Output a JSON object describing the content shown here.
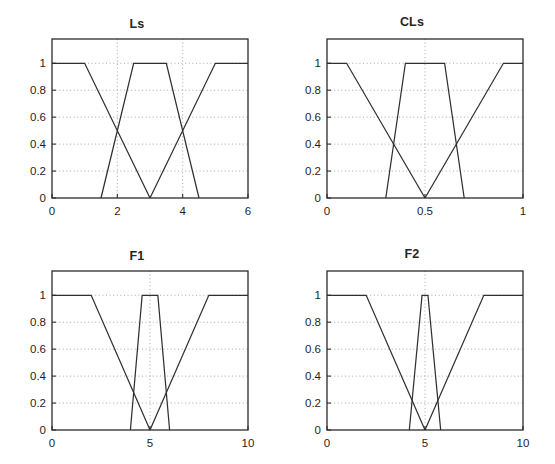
{
  "figure": {
    "background_color": "#ffffff",
    "axis_color": "#2b2b2b",
    "grid_color": "#9a9a9a",
    "curve_color": "#303030",
    "text_color": "#1f1f1f",
    "layout": "2x2 subplot grid"
  },
  "chart_data": [
    {
      "type": "line",
      "title": "Ls",
      "xlabel": "",
      "ylabel": "",
      "xlim": [
        0,
        6
      ],
      "ylim": [
        0,
        1.18
      ],
      "xticks": [
        0,
        2,
        4,
        6
      ],
      "xtick_labels": [
        "0",
        "2",
        "4",
        "6"
      ],
      "yticks": [
        0,
        0.2,
        0.4,
        0.6,
        0.8,
        1
      ],
      "ytick_labels": [
        "0",
        "0.2",
        "0.4",
        "0.6",
        "0.8",
        "1"
      ],
      "grid": true,
      "legend": "none",
      "series": [
        {
          "name": "low",
          "x": [
            0,
            1,
            3
          ],
          "values": [
            1,
            1,
            0
          ]
        },
        {
          "name": "medium",
          "x": [
            1.5,
            2.5,
            3.5,
            4.5
          ],
          "values": [
            0,
            1,
            1,
            0
          ]
        },
        {
          "name": "high",
          "x": [
            3,
            5,
            6
          ],
          "values": [
            0,
            1,
            1
          ]
        }
      ],
      "crossings": [
        {
          "x": 2,
          "y": 0.5
        },
        {
          "x": 4,
          "y": 0.5
        }
      ]
    },
    {
      "type": "line",
      "title": "CLs",
      "xlabel": "",
      "ylabel": "",
      "xlim": [
        0,
        1
      ],
      "ylim": [
        0,
        1.18
      ],
      "xticks": [
        0,
        0.5,
        1
      ],
      "xtick_labels": [
        "0",
        "0.5",
        "1"
      ],
      "yticks": [
        0,
        0.2,
        0.4,
        0.6,
        0.8,
        1
      ],
      "ytick_labels": [
        "0",
        "0.2",
        "0.4",
        "0.6",
        "0.8",
        "1"
      ],
      "grid": true,
      "legend": "none",
      "series": [
        {
          "name": "low",
          "x": [
            0,
            0.1,
            0.5
          ],
          "values": [
            1,
            1,
            0
          ]
        },
        {
          "name": "medium",
          "x": [
            0.3,
            0.4,
            0.6,
            0.7
          ],
          "values": [
            0,
            1,
            1,
            0
          ]
        },
        {
          "name": "high",
          "x": [
            0.5,
            0.9,
            1
          ],
          "values": [
            0,
            1,
            1
          ]
        }
      ],
      "crossings": [
        {
          "x": 0.34,
          "y": 0.41
        },
        {
          "x": 0.66,
          "y": 0.41
        }
      ]
    },
    {
      "type": "line",
      "title": "F1",
      "xlabel": "",
      "ylabel": "",
      "xlim": [
        0,
        10
      ],
      "ylim": [
        0,
        1.18
      ],
      "xticks": [
        0,
        5,
        10
      ],
      "xtick_labels": [
        "0",
        "5",
        "10"
      ],
      "yticks": [
        0,
        0.2,
        0.4,
        0.6,
        0.8,
        1
      ],
      "ytick_labels": [
        "0",
        "0.2",
        "0.4",
        "0.6",
        "0.8",
        "1"
      ],
      "grid": true,
      "legend": "none",
      "series": [
        {
          "name": "low",
          "x": [
            0,
            2,
            5
          ],
          "values": [
            1,
            1,
            0
          ]
        },
        {
          "name": "medium",
          "x": [
            4,
            4.6,
            5.4,
            6
          ],
          "values": [
            0,
            1,
            1,
            0
          ]
        },
        {
          "name": "high",
          "x": [
            5,
            8,
            10
          ],
          "values": [
            0,
            1,
            1
          ]
        }
      ],
      "crossings": [
        {
          "x": 4.3,
          "y": 0.28
        },
        {
          "x": 5.7,
          "y": 0.28
        }
      ]
    },
    {
      "type": "line",
      "title": "F2",
      "xlabel": "",
      "ylabel": "",
      "xlim": [
        0,
        10
      ],
      "ylim": [
        0,
        1.18
      ],
      "xticks": [
        0,
        5,
        10
      ],
      "xtick_labels": [
        "0",
        "5",
        "10"
      ],
      "yticks": [
        0,
        0.2,
        0.4,
        0.6,
        0.8,
        1
      ],
      "ytick_labels": [
        "0",
        "0.2",
        "0.4",
        "0.6",
        "0.8",
        "1"
      ],
      "grid": true,
      "legend": "none",
      "series": [
        {
          "name": "low",
          "x": [
            0,
            2,
            5
          ],
          "values": [
            1,
            1,
            0
          ]
        },
        {
          "name": "medium",
          "x": [
            4.2,
            4.85,
            5.15,
            5.8
          ],
          "values": [
            0,
            1,
            1,
            0
          ]
        },
        {
          "name": "high",
          "x": [
            5,
            8,
            10
          ],
          "values": [
            0,
            1,
            1
          ]
        }
      ],
      "crossings": [
        {
          "x": 4.38,
          "y": 0.21
        },
        {
          "x": 5.62,
          "y": 0.21
        }
      ]
    }
  ],
  "panels": [
    {
      "key": "ls",
      "title": "Ls",
      "left": 13,
      "top": 17
    },
    {
      "key": "cls",
      "title": "CLs",
      "left": 288,
      "top": 15
    },
    {
      "key": "f1",
      "title": "F1",
      "left": 13,
      "top": 249
    },
    {
      "key": "f2",
      "title": "F2",
      "left": 288,
      "top": 247
    }
  ]
}
